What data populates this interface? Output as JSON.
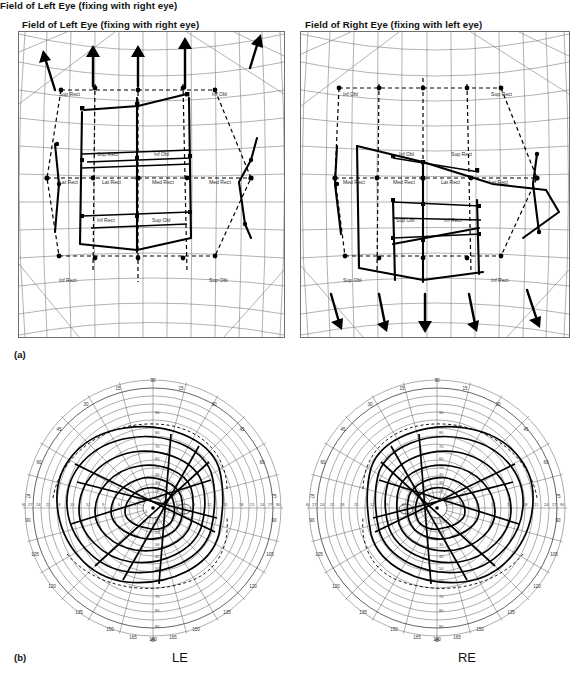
{
  "figure": {
    "panel_a_letter": "(a)",
    "panel_b_letter": "(b)"
  },
  "panels": {
    "a": {
      "left": {
        "title": "Field of Left Eye (fixing with right eye)",
        "arrow_direction": "up",
        "arrow_count": 5,
        "muscle_labels": [
          {
            "text": "Sup Rect",
            "x": 40,
            "y": 64
          },
          {
            "text": "Inf Obl",
            "x": 193,
            "y": 64
          },
          {
            "text": "Sup Rect",
            "x": 78,
            "y": 124
          },
          {
            "text": "Inf Obl",
            "x": 135,
            "y": 124
          },
          {
            "text": "Lat Rect",
            "x": 40,
            "y": 152
          },
          {
            "text": "Lat Rect",
            "x": 83,
            "y": 152
          },
          {
            "text": "Med Rect",
            "x": 133,
            "y": 152
          },
          {
            "text": "Med Rect",
            "x": 190,
            "y": 152
          },
          {
            "text": "Inf Rect",
            "x": 78,
            "y": 190
          },
          {
            "text": "Sup Obl",
            "x": 133,
            "y": 190
          },
          {
            "text": "Inf Rect",
            "x": 40,
            "y": 250
          },
          {
            "text": "Sup Obl",
            "x": 190,
            "y": 250
          }
        ]
      },
      "right": {
        "title": "Field of Right Eye (fixing with left eye)",
        "arrow_direction": "down",
        "arrow_count": 5,
        "muscle_labels": [
          {
            "text": "Inf Obl",
            "x": 42,
            "y": 64
          },
          {
            "text": "Sup Rect",
            "x": 190,
            "y": 64
          },
          {
            "text": "Inf Obl",
            "x": 98,
            "y": 124
          },
          {
            "text": "Sup Rect",
            "x": 150,
            "y": 124
          },
          {
            "text": "Med Rect",
            "x": 42,
            "y": 152
          },
          {
            "text": "Med Rect",
            "x": 92,
            "y": 152
          },
          {
            "text": "Lat Rect",
            "x": 140,
            "y": 152
          },
          {
            "text": "Lat Rect",
            "x": 188,
            "y": 152
          },
          {
            "text": "Sup Obl",
            "x": 95,
            "y": 190
          },
          {
            "text": "Inf Rect",
            "x": 143,
            "y": 190
          },
          {
            "text": "Sup Obl",
            "x": 42,
            "y": 250
          },
          {
            "text": "Inf Rect",
            "x": 190,
            "y": 250
          }
        ]
      }
    },
    "b": {
      "left": {
        "eye_label": "LE",
        "theta_symbol": "Θ",
        "angle_ticks": [
          15,
          30,
          45,
          60,
          75,
          90,
          105,
          120,
          135,
          150,
          165,
          180
        ],
        "radial_ticks_right": [
          3,
          6,
          9,
          12,
          15,
          18,
          21,
          24,
          27,
          90
        ],
        "radial_ticks_left": [
          3,
          6,
          9,
          12,
          15,
          18,
          21,
          24,
          27,
          90
        ],
        "radial_ticks_vertical": [
          10,
          20,
          30,
          40,
          50,
          60,
          70,
          80,
          90
        ]
      },
      "right": {
        "eye_label": "RE",
        "theta_symbol": "Θ",
        "angle_ticks": [
          15,
          30,
          45,
          60,
          75,
          90,
          105,
          120,
          135,
          150,
          165,
          180
        ],
        "radial_ticks_right": [
          3,
          6,
          9,
          12,
          15,
          18,
          21,
          24,
          27,
          90
        ],
        "radial_ticks_left": [
          3,
          6,
          9,
          12,
          15,
          18,
          21,
          24,
          27,
          90
        ],
        "radial_ticks_vertical": [
          10,
          20,
          30,
          40,
          50,
          60,
          70,
          80,
          90
        ]
      }
    }
  },
  "chart_data": {
    "type": "line",
    "subtitle": "Field of Left Eye / Field of Right Eye with extraocular muscle action positions",
    "muscles": [
      "Sup Rect",
      "Inf Obl",
      "Lat Rect",
      "Med Rect",
      "Inf Rect",
      "Sup Obl"
    ],
    "panels": [
      "a",
      "b"
    ],
    "eyes": [
      "LE",
      "RE"
    ],
    "angle_axis_label": "Θ",
    "angle_range": [
      0,
      180
    ],
    "angle_step": 15,
    "radial_range": [
      0,
      90
    ],
    "radial_step": 3,
    "grid": true,
    "legend_position": "none"
  },
  "colors": {
    "trace": "#000000",
    "grid": "#7d7d7d",
    "border": "#6f6f6f",
    "text": "#111111",
    "label_text": "#2a2a2a"
  }
}
